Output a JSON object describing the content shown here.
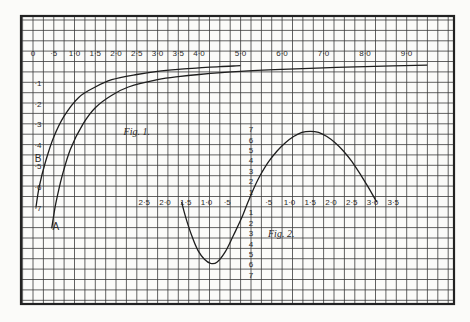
{
  "chart_data": [
    {
      "type": "line",
      "title": "Fig. 1.",
      "xlabel": "",
      "ylabel": "",
      "x_tick_labels": [
        "0",
        "·5",
        "1·0",
        "1·5",
        "2·0",
        "2·5",
        "3·0",
        "3·5",
        "4·0",
        "5·0",
        "6·0",
        "7·0",
        "8·0",
        "9·0"
      ],
      "x_ticks": [
        0,
        0.5,
        1.0,
        1.5,
        2.0,
        2.5,
        3.0,
        3.5,
        4.0,
        5.0,
        6.0,
        7.0,
        8.0,
        9.0
      ],
      "y_tick_labels": [
        "·1",
        "·2",
        "·3",
        "·4",
        "·5",
        "·6",
        "·7"
      ],
      "y_ticks": [
        0.1,
        0.2,
        0.3,
        0.4,
        0.5,
        0.6,
        0.7
      ],
      "y_direction": "downward",
      "xlim": [
        0,
        9.7
      ],
      "ylim": [
        0,
        0.8
      ],
      "grid": true,
      "series": [
        {
          "name": "B",
          "x": [
            0.07,
            0.15,
            0.3,
            0.5,
            0.75,
            1.1,
            1.5,
            1.9,
            2.5,
            3.0,
            3.5,
            4.0,
            4.5,
            5.0
          ],
          "y": [
            0.7,
            0.6,
            0.48,
            0.36,
            0.26,
            0.17,
            0.12,
            0.085,
            0.06,
            0.045,
            0.035,
            0.028,
            0.022,
            0.018
          ]
        },
        {
          "name": "A",
          "x": [
            0.45,
            0.55,
            0.7,
            0.9,
            1.2,
            1.5,
            1.9,
            2.3,
            3.0,
            3.5,
            4.0,
            5.0,
            6.0,
            7.0,
            8.0,
            9.5
          ],
          "y": [
            0.8,
            0.68,
            0.55,
            0.42,
            0.3,
            0.22,
            0.16,
            0.12,
            0.085,
            0.07,
            0.06,
            0.045,
            0.035,
            0.028,
            0.022,
            0.015
          ]
        }
      ],
      "annotations": [
        {
          "text": "B",
          "x": 0.12,
          "y": 0.46
        },
        {
          "text": "A",
          "x": 0.55,
          "y": 0.79
        },
        {
          "text": "Fig. 1.",
          "x": 2.5,
          "y": 0.33
        }
      ]
    },
    {
      "type": "line",
      "title": "Fig. 2.",
      "xlabel": "",
      "ylabel": "",
      "x_tick_labels": [
        "2·5",
        "2·0",
        "1·5",
        "1·0",
        "·5",
        "·5",
        "1·0",
        "1·5",
        "2·0",
        "2·5",
        "3·0",
        "3·5"
      ],
      "x_ticks": [
        -2.5,
        -2.0,
        -1.5,
        -1.0,
        -0.5,
        0.5,
        1.0,
        1.5,
        2.0,
        2.5,
        3.0,
        3.5
      ],
      "y_tick_labels_up": [
        "1",
        "2",
        "3",
        "4",
        "5",
        "6",
        "7"
      ],
      "y_tick_labels_down": [
        "1",
        "2",
        "3",
        "4",
        "5",
        "6",
        "7"
      ],
      "y_ticks": [
        -7,
        -6,
        -5,
        -4,
        -3,
        -2,
        -1,
        1,
        2,
        3,
        4,
        5,
        6,
        7
      ],
      "xlim": [
        -2.7,
        3.7
      ],
      "ylim": [
        -7.5,
        7.5
      ],
      "grid": true,
      "series": [
        {
          "name": "curve",
          "x": [
            -1.6,
            -1.5,
            -1.35,
            -1.2,
            -1.05,
            -0.9,
            -0.75,
            -0.55,
            -0.35,
            -0.15,
            0.0,
            0.15,
            0.3,
            0.5,
            0.7,
            0.9,
            1.1,
            1.3,
            1.5,
            1.7,
            1.9,
            2.1,
            2.3,
            2.5,
            2.7,
            2.9,
            3.1
          ],
          "y": [
            0.0,
            -1.5,
            -3.3,
            -4.7,
            -5.5,
            -5.9,
            -5.8,
            -4.8,
            -3.2,
            -1.5,
            0.0,
            1.4,
            2.6,
            3.9,
            4.9,
            5.7,
            6.3,
            6.7,
            6.8,
            6.7,
            6.3,
            5.7,
            4.9,
            3.9,
            2.7,
            1.4,
            0.0
          ]
        }
      ],
      "annotations": [
        {
          "text": "Fig. 2.",
          "x": 0.8,
          "y": -3
        }
      ]
    }
  ]
}
